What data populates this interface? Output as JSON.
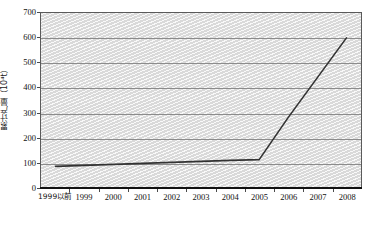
{
  "chart_data": {
    "type": "line",
    "title": "",
    "subtitle": "",
    "xlabel": "",
    "ylabel": "累计产量（10⁴t）",
    "ylabel_text": "累计产量（10",
    "ylabel_unit_exp": "4",
    "ylabel_unit_tail": "t）",
    "categories": [
      "1999以前",
      "1999",
      "2000",
      "2001",
      "2002",
      "2003",
      "2004",
      "2005",
      "2006",
      "2007",
      "2008"
    ],
    "values": [
      83,
      87,
      91,
      95,
      99,
      103,
      107,
      110,
      280,
      440,
      600
    ],
    "series": [
      {
        "name": "累计产量",
        "values": [
          83,
          87,
          91,
          95,
          99,
          103,
          107,
          110,
          280,
          440,
          600
        ]
      }
    ],
    "ylim": [
      0,
      700
    ],
    "yticks": [
      0,
      100,
      200,
      300,
      400,
      500,
      600,
      700
    ],
    "ytick_labels": [
      "0",
      "100",
      "200",
      "300",
      "400",
      "500",
      "600",
      "700"
    ],
    "grid": true,
    "grid_axis": "y",
    "legend": false,
    "legend_position": "none",
    "line_color": "#333333",
    "plot_background": "#d9d9d9",
    "frame_color": "#5a5a5a"
  }
}
